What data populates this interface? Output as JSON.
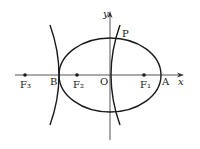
{
  "diagram": {
    "axes": {
      "x_label": "x",
      "y_label": "y",
      "origin_label": "O"
    },
    "points": {
      "F3": "F₃",
      "B": "B",
      "F2": "F₂",
      "O": "O",
      "F1": "F₁",
      "A": "A",
      "P": "P"
    },
    "colors": {
      "stroke": "#1a1a1a",
      "axis": "#555555",
      "background": "#ffffff"
    }
  }
}
